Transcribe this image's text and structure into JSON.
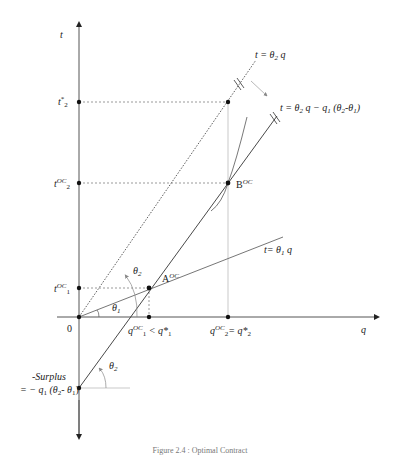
{
  "diagram": {
    "axes": {
      "vertical_label": "t",
      "horizontal_label": "q",
      "origin_label": "0"
    },
    "vertical_ticks": [
      {
        "base": "t",
        "sup": "*",
        "sub": "2",
        "id": "t-star-2"
      },
      {
        "base": "t",
        "sup": "OC",
        "sub": "2",
        "id": "t-oc-2"
      },
      {
        "base": "t",
        "sup": "OC",
        "sub": "1",
        "id": "t-oc-1"
      }
    ],
    "horizontal_ticks": [
      {
        "text": "q",
        "sup": "OC",
        "sub": "1",
        "suffix": " < q*",
        "suffix_sub": "1"
      },
      {
        "text": "q",
        "sup": "OC",
        "sub": "2",
        "suffix": "=  q*",
        "suffix_sub": "2"
      }
    ],
    "lines": {
      "theta2_line": {
        "prefix": "t = θ",
        "sub": "2",
        "suffix": " q"
      },
      "shifted_line": {
        "prefix": "t = θ",
        "sub": "2",
        "mid": " q − q",
        "sub2": "1",
        "rest": " (θ",
        "sub3": "2",
        "rest2": "-θ",
        "sub4": "1",
        "end": ")"
      },
      "theta1_line": {
        "prefix": "t= θ",
        "sub": "1",
        "suffix": " q"
      }
    },
    "points": {
      "A": {
        "base": "A",
        "sup": "OC"
      },
      "B": {
        "base": "B",
        "sup": "OC"
      }
    },
    "angles": {
      "theta1": {
        "base": "θ",
        "sub": "1"
      },
      "theta2_upper": {
        "base": "θ",
        "sub": "2"
      },
      "theta2_lower": {
        "base": "θ",
        "sub": "2"
      }
    },
    "surplus": {
      "line1": "-Surplus",
      "line2_prefix": "= − q",
      "line2_sub1": "1",
      "line2_mid": " (θ",
      "line2_sub2": "2",
      "line2_mid2": "- θ",
      "line2_sub3": "1",
      "line2_end": ")"
    },
    "caption": "Figure 2.4 : Optimal Contract"
  }
}
